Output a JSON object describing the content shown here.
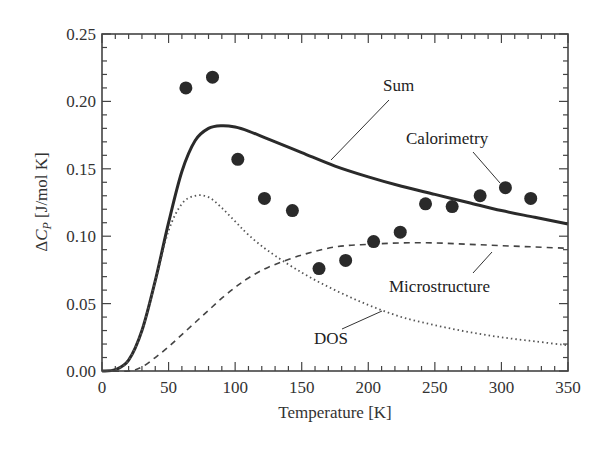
{
  "chart_data": {
    "type": "line",
    "title": "",
    "xlabel": "Temperature [K]",
    "ylabel": "ΔC_P [J/mol K]",
    "ylabel_parts": {
      "delta": "Δ",
      "symbol": "C",
      "subscript": "P",
      "units": " [J/mol K]"
    },
    "xlim": [
      0,
      350
    ],
    "ylim": [
      0,
      0.25
    ],
    "grid": false,
    "legend": "none (inline annotations)",
    "xticks": [
      "0",
      "50",
      "100",
      "150",
      "200",
      "250",
      "300",
      "350"
    ],
    "yticks": [
      "0.00",
      "0.05",
      "0.10",
      "0.15",
      "0.20",
      "0.25"
    ],
    "series": [
      {
        "name": "Sum",
        "style": "solid",
        "x": [
          0,
          10,
          20,
          30,
          40,
          50,
          60,
          70,
          80,
          90,
          100,
          110,
          125,
          150,
          175,
          200,
          225,
          250,
          275,
          300,
          325,
          350
        ],
        "values": [
          0.0,
          0.001,
          0.008,
          0.03,
          0.067,
          0.11,
          0.148,
          0.171,
          0.18,
          0.182,
          0.181,
          0.178,
          0.172,
          0.162,
          0.152,
          0.144,
          0.137,
          0.131,
          0.125,
          0.119,
          0.114,
          0.109
        ]
      },
      {
        "name": "DOS",
        "style": "dotted",
        "x": [
          0,
          10,
          20,
          30,
          40,
          50,
          60,
          70,
          80,
          90,
          100,
          110,
          125,
          150,
          175,
          200,
          225,
          250,
          275,
          300,
          325,
          350
        ],
        "values": [
          0.0,
          0.001,
          0.008,
          0.03,
          0.066,
          0.104,
          0.124,
          0.13,
          0.129,
          0.121,
          0.111,
          0.101,
          0.089,
          0.073,
          0.06,
          0.049,
          0.04,
          0.034,
          0.029,
          0.025,
          0.022,
          0.019
        ]
      },
      {
        "name": "Microstructure",
        "style": "dashed",
        "x": [
          0,
          20,
          30,
          40,
          50,
          60,
          70,
          80,
          90,
          100,
          110,
          125,
          150,
          175,
          200,
          225,
          250,
          275,
          300,
          325,
          350
        ],
        "values": [
          0.0,
          0.0,
          0.003,
          0.01,
          0.018,
          0.027,
          0.036,
          0.045,
          0.054,
          0.062,
          0.069,
          0.077,
          0.086,
          0.092,
          0.094,
          0.095,
          0.095,
          0.094,
          0.093,
          0.092,
          0.091
        ]
      },
      {
        "name": "Calorimetry",
        "style": "markers",
        "x": [
          63,
          83,
          102,
          122,
          143,
          163,
          183,
          204,
          224,
          243,
          263,
          284,
          303,
          322
        ],
        "values": [
          0.21,
          0.218,
          0.157,
          0.128,
          0.119,
          0.076,
          0.082,
          0.096,
          0.103,
          0.124,
          0.122,
          0.13,
          0.136,
          0.128
        ]
      }
    ],
    "annotations": [
      {
        "text": "Sum",
        "target": "Sum"
      },
      {
        "text": "Calorimetry",
        "target": "Calorimetry"
      },
      {
        "text": "Microstructure",
        "target": "Microstructure"
      },
      {
        "text": "DOS",
        "target": "DOS"
      }
    ]
  }
}
